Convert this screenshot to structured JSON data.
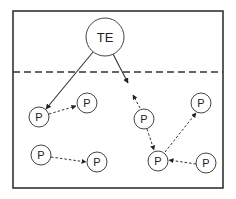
{
  "diagram": {
    "frame": {
      "x": 13,
      "y": 11,
      "w": 210,
      "h": 177,
      "stroke": "#333333"
    },
    "divider": {
      "y": 72,
      "style": "dashed",
      "stroke": "#333333"
    },
    "nodes": [
      {
        "id": "te",
        "label": "TE",
        "cx": 105,
        "cy": 37,
        "r": 19
      },
      {
        "id": "p1",
        "label": "P",
        "cx": 39,
        "cy": 117,
        "r": 10
      },
      {
        "id": "p2",
        "label": "P",
        "cx": 87,
        "cy": 103,
        "r": 10
      },
      {
        "id": "p3",
        "label": "P",
        "cx": 41,
        "cy": 155,
        "r": 10
      },
      {
        "id": "p4",
        "label": "P",
        "cx": 97,
        "cy": 162,
        "r": 10
      },
      {
        "id": "p5",
        "label": "P",
        "cx": 144,
        "cy": 119,
        "r": 10
      },
      {
        "id": "p6",
        "label": "P",
        "cx": 201,
        "cy": 103,
        "r": 10
      },
      {
        "id": "p7",
        "label": "P",
        "cx": 158,
        "cy": 161,
        "r": 10
      },
      {
        "id": "p8",
        "label": "P",
        "cx": 206,
        "cy": 163,
        "r": 10
      }
    ],
    "edges": [
      {
        "from": "te",
        "to": "p1",
        "style": "solid",
        "x1": 93,
        "y1": 52,
        "x2": 46,
        "y2": 109
      },
      {
        "from": "te",
        "to": "open",
        "style": "solid",
        "x1": 113,
        "y1": 54,
        "x2": 128,
        "y2": 83
      },
      {
        "from": "p5",
        "to": "open",
        "style": "dashed",
        "x1": 140,
        "y1": 108,
        "x2": 133,
        "y2": 95
      },
      {
        "from": "p1",
        "to": "p2",
        "style": "dashed",
        "x1": 49,
        "y1": 114,
        "x2": 76,
        "y2": 106
      },
      {
        "from": "p3",
        "to": "p4",
        "style": "dashed",
        "x1": 51,
        "y1": 157,
        "x2": 86,
        "y2": 162
      },
      {
        "from": "p5",
        "to": "p7",
        "style": "dashed",
        "x1": 147,
        "y1": 129,
        "x2": 154,
        "y2": 150
      },
      {
        "from": "p7",
        "to": "p6",
        "style": "dashed",
        "x1": 165,
        "y1": 152,
        "x2": 196,
        "y2": 113
      },
      {
        "from": "p8",
        "to": "p7",
        "style": "dashed",
        "x1": 196,
        "y1": 164,
        "x2": 169,
        "y2": 160
      }
    ]
  }
}
